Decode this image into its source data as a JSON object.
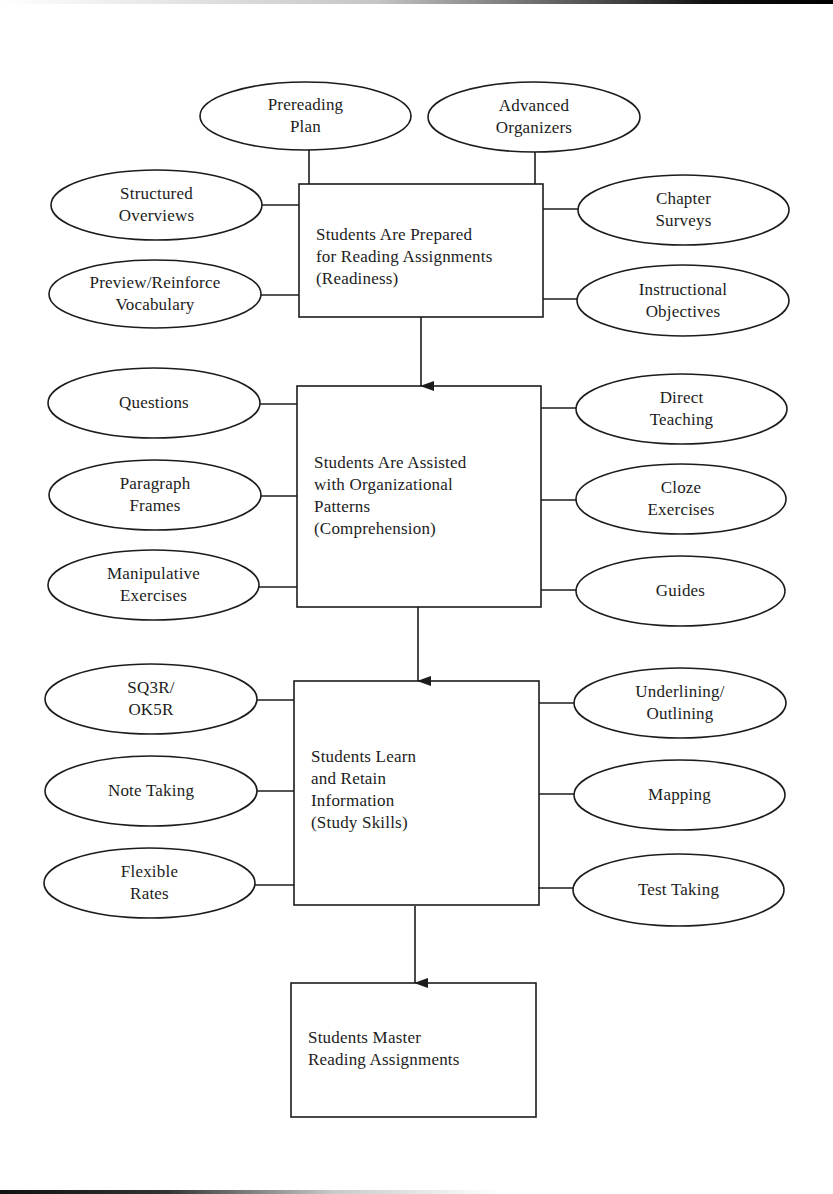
{
  "diagram": {
    "type": "flowchart",
    "colors": {
      "ink": "#1c1c1c",
      "paper": "#ffffff"
    },
    "boxes": [
      {
        "id": "readiness",
        "lines": [
          "Students Are Prepared",
          "for Reading Assignments",
          "(Readiness)"
        ],
        "left_ovals": [
          {
            "lines": [
              "Structured",
              "Overviews"
            ]
          },
          {
            "lines": [
              "Preview/Reinforce",
              "Vocabulary"
            ]
          }
        ],
        "top_ovals": [
          {
            "lines": [
              "Prereading",
              "Plan"
            ]
          },
          {
            "lines": [
              "Advanced",
              "Organizers"
            ]
          }
        ],
        "right_ovals": [
          {
            "lines": [
              "Chapter",
              "Surveys"
            ]
          },
          {
            "lines": [
              "Instructional",
              "Objectives"
            ]
          }
        ]
      },
      {
        "id": "comprehension",
        "lines": [
          "Students Are Assisted",
          "with Organizational",
          "Patterns",
          "(Comprehension)"
        ],
        "left_ovals": [
          {
            "lines": [
              "Questions"
            ]
          },
          {
            "lines": [
              "Paragraph",
              "Frames"
            ]
          },
          {
            "lines": [
              "Manipulative",
              "Exercises"
            ]
          }
        ],
        "right_ovals": [
          {
            "lines": [
              "Direct",
              "Teaching"
            ]
          },
          {
            "lines": [
              "Cloze",
              "Exercises"
            ]
          },
          {
            "lines": [
              "Guides"
            ]
          }
        ]
      },
      {
        "id": "study-skills",
        "lines": [
          "Students Learn",
          "and Retain",
          "Information",
          "(Study Skills)"
        ],
        "left_ovals": [
          {
            "lines": [
              "SQ3R/",
              "OK5R"
            ]
          },
          {
            "lines": [
              "Note Taking"
            ]
          },
          {
            "lines": [
              "Flexible",
              "Rates"
            ]
          }
        ],
        "right_ovals": [
          {
            "lines": [
              "Underlining/",
              "Outlining"
            ]
          },
          {
            "lines": [
              "Mapping"
            ]
          },
          {
            "lines": [
              "Test Taking"
            ]
          }
        ]
      },
      {
        "id": "mastery",
        "lines": [
          "Students Master",
          "Reading Assignments"
        ]
      }
    ],
    "flow": [
      "readiness",
      "comprehension",
      "study-skills",
      "mastery"
    ]
  }
}
